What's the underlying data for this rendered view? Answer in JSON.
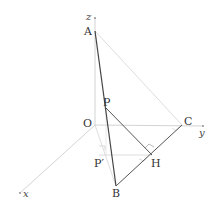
{
  "diagram": {
    "type": "3d-coordinate-geometry",
    "axes": {
      "x": {
        "label": "x"
      },
      "y": {
        "label": "y"
      },
      "z": {
        "label": "z"
      },
      "origin": {
        "label": "O"
      }
    },
    "points": {
      "A": {
        "label": "A"
      },
      "B": {
        "label": "B"
      },
      "C": {
        "label": "C"
      },
      "P": {
        "label": "P"
      },
      "H": {
        "label": "H"
      },
      "P_prime": {
        "label": "P′"
      }
    },
    "segments": [
      "AB",
      "BC",
      "PH",
      "AC (faint)",
      "OB (faint)",
      "P′H (faint)"
    ],
    "right_angle_marks": [
      "at H (PH ⊥ BC)",
      "at C (on y-axis)",
      "at P′",
      "at H (P′H ⊥ BC)"
    ],
    "colors": {
      "bold_line": "#444444",
      "faint_line": "#cfcfcf",
      "axis_line": "#c8c8c8",
      "label": "#333333"
    }
  }
}
